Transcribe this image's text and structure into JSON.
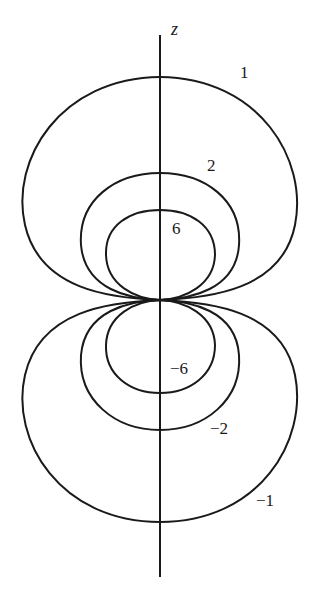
{
  "diagram": {
    "axis_label": "z",
    "ink_color": "#1a1a1a",
    "background": "#ffffff",
    "contours": [
      {
        "value": "1",
        "label": "1"
      },
      {
        "value": "2",
        "label": "2"
      },
      {
        "value": "6",
        "label": "6"
      },
      {
        "value": "-6",
        "label": "−6"
      },
      {
        "value": "-2",
        "label": "−2"
      },
      {
        "value": "-1",
        "label": "−1"
      }
    ]
  }
}
